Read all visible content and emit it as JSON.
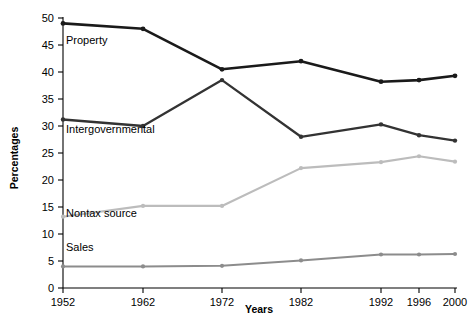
{
  "chart_data": {
    "type": "line",
    "title": "",
    "xlabel": "Years",
    "ylabel": "Percentages",
    "categories": [
      "1952",
      "1962",
      "1972",
      "1982",
      "1992",
      "1996",
      "2000"
    ],
    "x": [
      1952,
      1962,
      1972,
      1982,
      1992,
      1996,
      2000
    ],
    "xtick_labels": [
      "1952",
      "1962",
      "1972",
      "1982",
      "1992",
      "1996",
      "2000"
    ],
    "ytick_labels": [
      "0",
      "5",
      "10",
      "15",
      "20",
      "25",
      "30",
      "35",
      "40",
      "45",
      "50"
    ],
    "yticks": [
      0,
      5,
      10,
      15,
      20,
      25,
      30,
      35,
      40,
      45,
      50
    ],
    "ylim": [
      0,
      50
    ],
    "grid": false,
    "legend_position": "inline-labels",
    "markers": "filled-circle",
    "series": [
      {
        "name": "Property",
        "label": "Property",
        "color": "#1a1a1a",
        "values": [
          49.0,
          48.0,
          40.5,
          42.0,
          38.2,
          38.5,
          39.3
        ]
      },
      {
        "name": "Intergovernmental",
        "label": "Intergovernmental",
        "color": "#333333",
        "values": [
          31.2,
          30.0,
          38.5,
          28.0,
          30.3,
          28.3,
          27.3
        ]
      },
      {
        "name": "Nontax source",
        "label": "Nontax source",
        "color": "#bcbcbc",
        "values": [
          13.2,
          15.2,
          15.2,
          22.2,
          23.3,
          24.4,
          23.4
        ]
      },
      {
        "name": "Sales",
        "label": "Sales",
        "color": "#8c8c8c",
        "values": [
          4.0,
          4.0,
          4.1,
          5.1,
          6.2,
          6.2,
          6.3
        ]
      }
    ]
  }
}
